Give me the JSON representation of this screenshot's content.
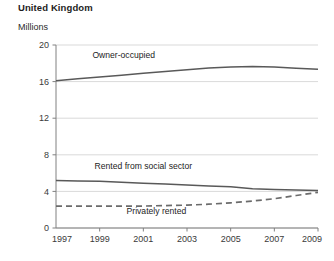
{
  "header": {
    "title": "United Kingdom",
    "unit_label": "Millions"
  },
  "chart_data": {
    "type": "line",
    "title": "United Kingdom",
    "subtitle": "Millions",
    "xlabel": "",
    "ylabel": "Millions",
    "xlim": [
      1997,
      2009
    ],
    "ylim": [
      0,
      20
    ],
    "yticks": [
      0,
      4,
      8,
      12,
      16,
      20
    ],
    "ytick_labels": [
      "0",
      "4",
      "8",
      "12",
      "16",
      "20"
    ],
    "xticks": [
      1997,
      1999,
      2001,
      2003,
      2005,
      2007,
      2009
    ],
    "xtick_labels": [
      "1997",
      "1999",
      "2001",
      "2003",
      "2005",
      "2007",
      "2009"
    ],
    "x": [
      1997,
      1998,
      1999,
      2000,
      2001,
      2002,
      2003,
      2004,
      2005,
      2006,
      2007,
      2008,
      2009
    ],
    "grid": "horizontal",
    "legend_position": "inline-labels",
    "series": [
      {
        "name": "Owner-occupied",
        "style": "solid",
        "color": "#595959",
        "label_x": 2000.1,
        "label_y": 18.6,
        "values": [
          16.1,
          16.3,
          16.5,
          16.7,
          16.9,
          17.1,
          17.3,
          17.5,
          17.6,
          17.65,
          17.6,
          17.45,
          17.35
        ]
      },
      {
        "name": "Rented from social sector",
        "style": "solid",
        "color": "#595959",
        "label_x": 2001.0,
        "label_y": 6.4,
        "values": [
          5.2,
          5.15,
          5.1,
          5.0,
          4.9,
          4.8,
          4.7,
          4.6,
          4.5,
          4.3,
          4.2,
          4.15,
          4.1
        ]
      },
      {
        "name": "Privately rented",
        "style": "dashed",
        "color": "#6b6b6b",
        "label_x": 2001.6,
        "label_y": 1.55,
        "values": [
          2.4,
          2.4,
          2.4,
          2.4,
          2.4,
          2.45,
          2.5,
          2.6,
          2.75,
          2.95,
          3.2,
          3.55,
          3.9
        ]
      }
    ],
    "colors": {
      "line": "#595959",
      "dashed_line": "#6b6b6b",
      "gridline": "#cfcfcf",
      "axis": "#808080",
      "text": "#2b2b2b"
    }
  }
}
